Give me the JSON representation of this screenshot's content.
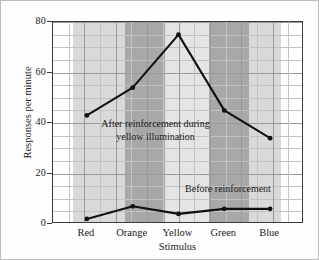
{
  "chart_data": {
    "type": "line",
    "title": "",
    "xlabel": "Stimulus",
    "ylabel": "Responses per minute",
    "categories": [
      "Red",
      "Orange",
      "Yellow",
      "Green",
      "Blue"
    ],
    "ylim": [
      0,
      80
    ],
    "yticks": [
      0,
      20,
      40,
      60,
      80
    ],
    "ytick_labels": [
      "0",
      "20",
      "40",
      "60",
      "80"
    ],
    "y_minor_step": 5,
    "grid": true,
    "legend_position": "inline-annotations",
    "series": [
      {
        "name": "After reinforcement during yellow illumination",
        "values": [
          43,
          54,
          75,
          45,
          34
        ],
        "color": "#111111",
        "marker": "circle"
      },
      {
        "name": "Before reinforcement",
        "values": [
          2,
          7,
          4,
          6,
          6
        ],
        "color": "#111111",
        "marker": "circle"
      }
    ],
    "annotations": [
      {
        "id": "after",
        "line1": "After reinforcement during",
        "line2": "yellow illumination"
      },
      {
        "id": "before",
        "line1": "Before reinforcement",
        "line2": ""
      }
    ],
    "bands": [
      {
        "label": "white-left",
        "start_pct": 0.0,
        "end_pct": 8.0,
        "color": "#ffffff"
      },
      {
        "label": "Red",
        "start_pct": 8.0,
        "end_pct": 28.5,
        "color": "#d9d9d9"
      },
      {
        "label": "Orange",
        "start_pct": 28.5,
        "end_pct": 44.5,
        "color": "#a8a8a8"
      },
      {
        "label": "Yellow",
        "start_pct": 44.5,
        "end_pct": 62.0,
        "color": "#e4e4e4"
      },
      {
        "label": "Green",
        "start_pct": 62.0,
        "end_pct": 78.0,
        "color": "#a8a8a8"
      },
      {
        "label": "Blue",
        "start_pct": 78.0,
        "end_pct": 91.0,
        "color": "#d9d9d9"
      },
      {
        "label": "white-right",
        "start_pct": 91.0,
        "end_pct": 100.0,
        "color": "#ffffff"
      }
    ]
  },
  "axes": {
    "y_label_text": "Responses per minute",
    "x_label_text": "Stimulus",
    "y_ticks": [
      {
        "value": 80,
        "label": "80"
      },
      {
        "value": 60,
        "label": "60"
      },
      {
        "value": 40,
        "label": "40"
      },
      {
        "value": 20,
        "label": "20"
      },
      {
        "value": 0,
        "label": "0"
      }
    ],
    "x_ticks": [
      {
        "label": "Red"
      },
      {
        "label": "Orange"
      },
      {
        "label": "Yellow"
      },
      {
        "label": "Green"
      },
      {
        "label": "Blue"
      }
    ]
  },
  "style": {
    "background": "#fefefe",
    "frame_color": "#3a3a3a",
    "grid_major": "#9a9a9a",
    "grid_minor": "#c3c3c3",
    "line_color": "#111111"
  }
}
